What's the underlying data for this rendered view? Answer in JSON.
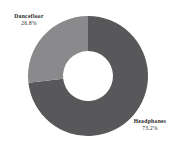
{
  "chart_data": {
    "type": "pie",
    "variant": "donut",
    "title": "",
    "subtitle": "",
    "xlabel": "",
    "ylabel": "",
    "legend": false,
    "legend_position": "none",
    "grid": false,
    "value_unit": "%",
    "start_angle_deg": 0,
    "direction": "clockwise",
    "background_color": "#ffffff",
    "categories": [
      "Headphones",
      "Dancefloor"
    ],
    "values": [
      73.2,
      26.8
    ],
    "slices": [
      {
        "label": "Headphones",
        "value": 73.2,
        "value_text": "73.2%",
        "color": "#58585a",
        "start_deg": 0,
        "end_deg": 263.52
      },
      {
        "label": "Dancefloor",
        "value": 26.8,
        "value_text": "26.8%",
        "color": "#8a8a8c",
        "start_deg": 263.52,
        "end_deg": 360
      }
    ],
    "annotations": [
      {
        "text": "Dancefloor",
        "value_text": "26.8%",
        "position": "top-left"
      },
      {
        "text": "Headphones",
        "value_text": "73.2%",
        "position": "bottom-right"
      }
    ]
  },
  "geometry": {
    "center_x": 88,
    "center_y": 76,
    "outer_radius": 60,
    "inner_radius": 25
  }
}
